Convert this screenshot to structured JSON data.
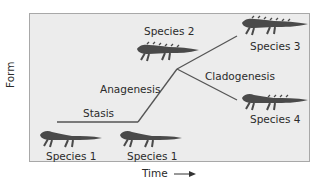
{
  "diagram": {
    "axes": {
      "y_label": "Form",
      "x_label": "Time"
    },
    "processes": {
      "stasis": "Stasis",
      "anagenesis": "Anagenesis",
      "cladogenesis": "Cladogenesis"
    },
    "species": [
      {
        "label": "Species 1",
        "position": "bottom-left"
      },
      {
        "label": "Species 1",
        "position": "bottom-middle"
      },
      {
        "label": "Species 2",
        "position": "top-middle"
      },
      {
        "label": "Species 3",
        "position": "top-right"
      },
      {
        "label": "Species 4",
        "position": "middle-right"
      }
    ],
    "colors": {
      "background": "#ececec",
      "border": "#a8a8a8",
      "line": "#555555",
      "animal": "#4a4a4a"
    }
  }
}
